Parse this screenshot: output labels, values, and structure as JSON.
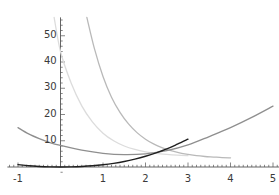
{
  "chart_data": {
    "type": "line",
    "title": "",
    "subtitle": "",
    "xlabel": "",
    "ylabel": "",
    "xlim": [
      -1.25,
      5.15
    ],
    "ylim": [
      -3,
      57
    ],
    "grid": false,
    "legend": "none",
    "axis_style": "crossing-axes-with-minor-ticks",
    "x_ticks": [
      -1,
      1,
      2,
      3,
      4,
      5
    ],
    "x_tick_labels": [
      "-1",
      "1",
      "2",
      "3",
      "4",
      "5"
    ],
    "x_minor_tick_step": 0.1,
    "y_ticks": [
      10,
      20,
      30,
      40,
      50
    ],
    "y_tick_labels": [
      "10",
      "20",
      "30",
      "40",
      "50"
    ],
    "y_minor_tick_step": 2,
    "series": [
      {
        "name": "steepest-decay-curve",
        "color": "#b9b9b9",
        "width": 1.3,
        "description": "steep decreasing convex curve entering top of frame near x=0.62 and flattening toward x=3",
        "x": [
          0.62,
          0.8,
          1.0,
          1.2,
          1.4,
          1.6,
          1.8,
          2.0,
          2.2,
          2.4,
          2.6,
          2.8,
          3.0,
          3.2,
          3.4,
          3.6,
          3.8,
          4.0
        ],
        "y": [
          57.0,
          45.0,
          34.5,
          26.6,
          20.8,
          16.4,
          13.1,
          10.6,
          8.7,
          7.3,
          6.2,
          5.4,
          4.8,
          4.3,
          4.0,
          3.8,
          3.6,
          3.5
        ]
      },
      {
        "name": "light-decay-curve",
        "color": "#dcdcdc",
        "width": 1.3,
        "description": "light gray decreasing convex curve entering top of frame near x=-0.12, passing about 44 at x=0",
        "x": [
          -0.15,
          0.0,
          0.25,
          0.5,
          0.75,
          1.0,
          1.25,
          1.5,
          1.75,
          2.0,
          2.25,
          2.5,
          2.75,
          3.0
        ],
        "y": [
          57.0,
          44.0,
          32.0,
          23.3,
          17.2,
          12.9,
          10.0,
          8.0,
          6.7,
          5.8,
          5.2,
          4.8,
          4.5,
          4.3
        ]
      },
      {
        "name": "shallow-u-curve",
        "color": "#8f8f8f",
        "width": 1.3,
        "description": "gently decreasing curve starting near 15 at x=-1, minimum about 4.6 near x=1.6, rising to about 23 at x=5",
        "x": [
          -1.0,
          -0.75,
          -0.5,
          -0.25,
          0.0,
          0.5,
          1.0,
          1.5,
          2.0,
          2.5,
          3.0,
          3.5,
          4.0,
          4.5,
          5.0
        ],
        "y": [
          15.0,
          12.6,
          10.8,
          9.3,
          8.2,
          6.4,
          5.2,
          4.7,
          5.0,
          6.2,
          8.4,
          11.6,
          15.0,
          18.9,
          23.2
        ]
      },
      {
        "name": "dark-rising-curve",
        "color": "#1f1f1f",
        "width": 1.4,
        "description": "near-zero dark curve hugging the x-axis from x=-1, rising steadily after x=1 and exiting the bottom-right region",
        "x": [
          -1.0,
          -0.75,
          -0.5,
          -0.25,
          0.0,
          0.25,
          0.5,
          0.75,
          1.0,
          1.25,
          1.5,
          1.75,
          2.0,
          2.25,
          2.5,
          2.75,
          3.0
        ],
        "y": [
          0.9,
          0.45,
          0.2,
          0.05,
          0.0,
          0.05,
          0.2,
          0.45,
          0.85,
          1.4,
          2.1,
          3.0,
          4.1,
          5.4,
          6.9,
          8.7,
          10.6
        ]
      }
    ],
    "axis_color": "#555555",
    "background_color": "#ffffff",
    "tick_label_color": "#3a3a3a"
  }
}
